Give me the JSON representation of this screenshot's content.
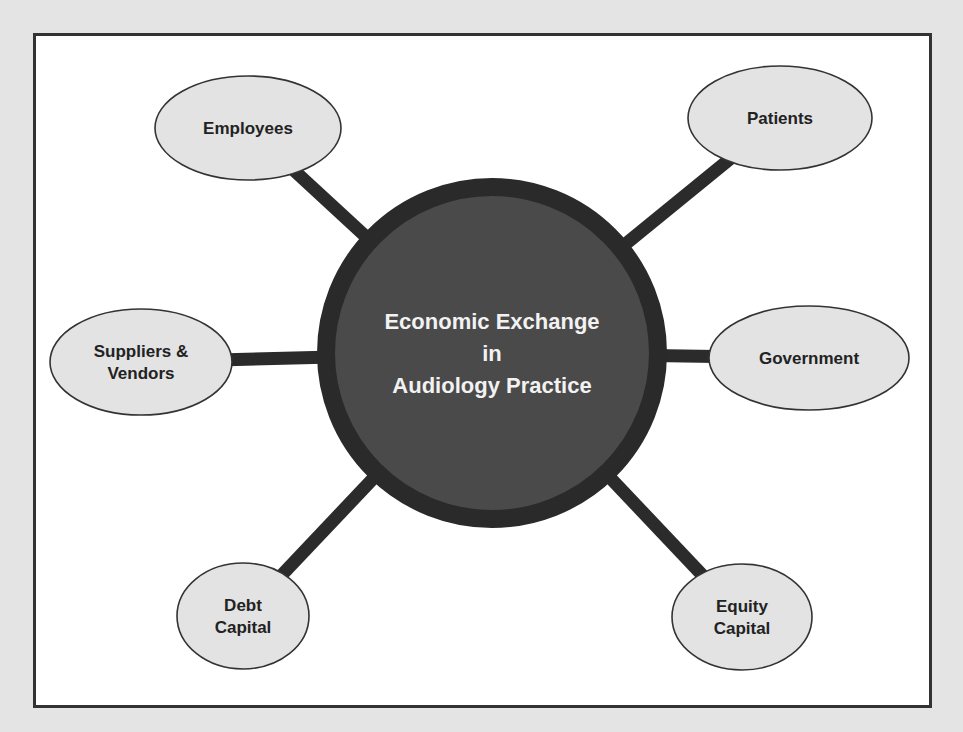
{
  "diagram": {
    "center": {
      "lines": [
        "Economic Exchange",
        "in",
        "Audiology Practice"
      ],
      "cx": 492,
      "cy": 353,
      "r": 166,
      "fill": "#4a4a4a",
      "ring": "#2a2a2a"
    },
    "nodes": [
      {
        "id": "employees",
        "lines": [
          "Employees"
        ],
        "cx": 248,
        "cy": 128,
        "rx": 93,
        "ry": 52,
        "link_to": [
          385,
          245
        ]
      },
      {
        "id": "patients",
        "lines": [
          "Patients"
        ],
        "cx": 780,
        "cy": 118,
        "rx": 92,
        "ry": 52,
        "link_to": [
          585,
          240
        ]
      },
      {
        "id": "suppliers-vendors",
        "lines": [
          "Suppliers &",
          "Vendors"
        ],
        "cx": 141,
        "cy": 362,
        "rx": 91,
        "ry": 53,
        "link_to": [
          325,
          367
        ]
      },
      {
        "id": "government",
        "lines": [
          "Government"
        ],
        "cx": 809,
        "cy": 358,
        "rx": 100,
        "ry": 52,
        "link_to": [
          660,
          368
        ]
      },
      {
        "id": "debt-capital",
        "lines": [
          "Debt",
          "Capital"
        ],
        "cx": 243,
        "cy": 616,
        "rx": 66,
        "ry": 53,
        "link_to": [
          410,
          482
        ]
      },
      {
        "id": "equity-capital",
        "lines": [
          "Equity",
          "Capital"
        ],
        "cx": 742,
        "cy": 617,
        "rx": 70,
        "ry": 53,
        "link_to": [
          585,
          488
        ]
      }
    ],
    "colors": {
      "node_fill": "#e3e3e3",
      "node_stroke": "#333333",
      "connector": "#2b2b2b",
      "frame_bg": "#ffffff",
      "page_bg": "#e4e4e4"
    }
  }
}
